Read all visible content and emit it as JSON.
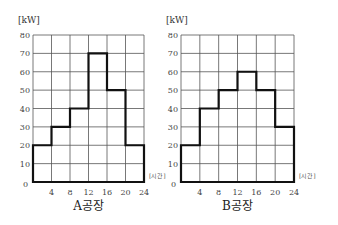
{
  "chart_data": [
    {
      "type": "line",
      "subtype": "step",
      "title": "A공장",
      "xlabel": "[시간]",
      "ylabel": "[kW]",
      "x_ticks": [
        0,
        4,
        8,
        12,
        16,
        20,
        24
      ],
      "y_ticks": [
        10,
        20,
        30,
        40,
        50,
        60,
        70,
        80
      ],
      "origin_label": "0",
      "xlim": [
        0,
        24
      ],
      "ylim": [
        0,
        80
      ],
      "grid": true,
      "intervals": [
        {
          "start": 0,
          "end": 4,
          "kw": 20
        },
        {
          "start": 4,
          "end": 8,
          "kw": 30
        },
        {
          "start": 8,
          "end": 12,
          "kw": 40
        },
        {
          "start": 12,
          "end": 16,
          "kw": 70
        },
        {
          "start": 16,
          "end": 20,
          "kw": 50
        },
        {
          "start": 20,
          "end": 24,
          "kw": 20
        }
      ]
    },
    {
      "type": "line",
      "subtype": "step",
      "title": "B공장",
      "xlabel": "[시간]",
      "ylabel": "[kW]",
      "x_ticks": [
        0,
        4,
        8,
        12,
        16,
        20,
        24
      ],
      "y_ticks": [
        10,
        20,
        30,
        40,
        50,
        60,
        70,
        80
      ],
      "origin_label": "0",
      "xlim": [
        0,
        24
      ],
      "ylim": [
        0,
        80
      ],
      "grid": true,
      "intervals": [
        {
          "start": 0,
          "end": 4,
          "kw": 20
        },
        {
          "start": 4,
          "end": 8,
          "kw": 40
        },
        {
          "start": 8,
          "end": 12,
          "kw": 50
        },
        {
          "start": 12,
          "end": 16,
          "kw": 60
        },
        {
          "start": 16,
          "end": 20,
          "kw": 50
        },
        {
          "start": 20,
          "end": 24,
          "kw": 30
        }
      ]
    }
  ]
}
